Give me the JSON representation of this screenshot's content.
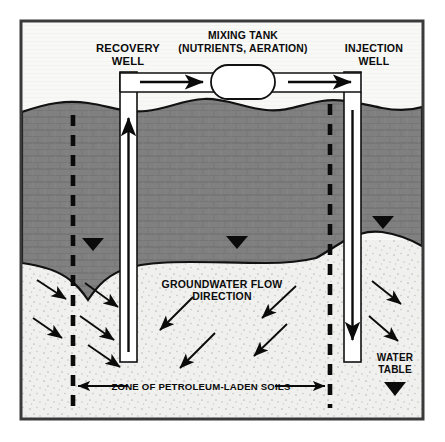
{
  "figure": {
    "frame": {
      "x": 20,
      "y": 20,
      "width": 404,
      "height": 400
    }
  },
  "labels": {
    "recovery_well_line1": "RECOVERY",
    "recovery_well_line2": "WELL",
    "mixing_tank_line1": "MIXING TANK",
    "mixing_tank_line2": "(NUTRIENTS, AERATION)",
    "injection_well_line1": "INJECTION",
    "injection_well_line2": "WELL",
    "groundwater_flow_line1": "GROUNDWATER FLOW",
    "groundwater_flow_line2": "DIRECTION",
    "water_table_line1": "WATER",
    "water_table_line2": "TABLE",
    "zone_caption": "ZONE OF PETROLEUM-LADEN SOILS"
  },
  "colors": {
    "background": "#ffffff",
    "frame_border": "#3a3a3a",
    "sky": "#f7f7f5",
    "vadose_soil": "#808080",
    "saturated_soil": "#f0f0ee",
    "ink": "#0b0b0b",
    "pipe_fill": "#ffffff",
    "tank_fill": "#ffffff"
  },
  "geometry": {
    "ground_surface_y": 104,
    "water_table_y": 252,
    "recovery_well_x": 128,
    "injection_well_x": 352,
    "zone_left_x": 73,
    "zone_right_x": 330,
    "pipe_top_y": 73,
    "pipe_bottom_y": 92,
    "tank_cx": 243,
    "tank_cy": 82
  },
  "flow": {
    "surface_arrows": [
      {
        "name": "pipe-arrow-recovery-to-tank",
        "direction": "right"
      },
      {
        "name": "pipe-arrow-tank-to-injection",
        "direction": "right"
      }
    ],
    "well_arrows": [
      {
        "name": "recovery-well-arrow",
        "direction": "up"
      },
      {
        "name": "injection-well-arrow",
        "direction": "down"
      }
    ],
    "groundwater_arrow_count": 12
  },
  "markers": {
    "water_table_triangles": 3,
    "water_table_legend_triangle": 1
  }
}
